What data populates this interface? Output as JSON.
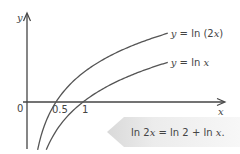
{
  "chart_data": {
    "type": "line",
    "title": "",
    "xlabel": "x",
    "ylabel": "y",
    "origin_label": "0",
    "xlim": [
      -0.05,
      3.6
    ],
    "ylim": [
      -1.2,
      2.1
    ],
    "x_ticks": [
      {
        "value": 0.5,
        "label": "0.5"
      },
      {
        "value": 1,
        "label": "1"
      }
    ],
    "series": [
      {
        "name": "y = ln (2x)",
        "label_parts": [
          "y",
          " = ln (2",
          "x",
          ")"
        ],
        "func": "ln2x",
        "x_range": [
          0.16,
          2.57
        ]
      },
      {
        "name": "y = ln x",
        "label_parts": [
          "y",
          " = ln ",
          "x",
          ""
        ],
        "func": "lnx",
        "x_range": [
          0.32,
          2.57
        ]
      }
    ],
    "grid": false,
    "annotation": {
      "text": "ln 2x = ln 2 + ln x.",
      "parts": [
        "ln 2",
        "x",
        " = ln 2 + ln ",
        "x",
        "."
      ]
    },
    "colors": {
      "curve": "#555555",
      "axis": "#444444",
      "callout_fill": "#e6e6e6"
    }
  }
}
